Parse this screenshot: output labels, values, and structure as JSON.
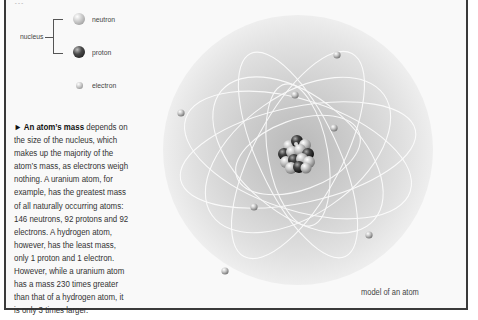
{
  "header": {
    "cutoff_text": "…"
  },
  "legend": {
    "group_label": "nucleus",
    "items": [
      {
        "label": "neutron",
        "icon": "neutron-sphere",
        "color": "#c4c4c4"
      },
      {
        "label": "proton",
        "icon": "proton-sphere",
        "color": "#2a2a2a"
      },
      {
        "label": "electron",
        "icon": "electron-sphere",
        "color": "#b0b0b0"
      }
    ]
  },
  "body_text": {
    "lead": "► An atom’s mass",
    "lines": [
      " depends on",
      "the size of the nucleus, which",
      "makes up the majority of the",
      "atom’s mass, as electrons weigh",
      "nothing. A uranium atom, for",
      "example,  has the greatest mass",
      "of all naturally occurring atoms:",
      "146 neutrons, 92 protons and 92",
      "electrons. A hydrogen atom,",
      "however, has the least mass,",
      "only 1 proton and 1 electron.",
      "However, while a uranium atom",
      "has a mass 230 times greater",
      "than that of a hydrogen atom, it",
      "is only 3 times larger."
    ]
  },
  "figure": {
    "caption": "model of an atom",
    "electron_count": 8
  },
  "colors": {
    "border": "#3a3a3a",
    "panel": "#f9f9f9",
    "text": "#333333"
  }
}
